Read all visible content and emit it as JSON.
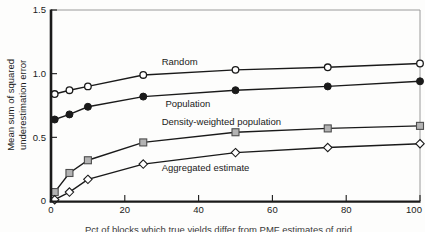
{
  "chart_data": {
    "type": "line",
    "title": "",
    "xlabel_partial_caption": "Pct of blocks which true yields differ from PMF estimates of grid",
    "ylabel": "Mean sum of squared underestimation error",
    "ylabel_lines": [
      "Mean sum of squared",
      "underestimation error"
    ],
    "x": [
      1,
      5,
      10,
      25,
      50,
      75,
      100
    ],
    "series": [
      {
        "name": "Random",
        "marker": "circle-open",
        "values": [
          0.84,
          0.87,
          0.9,
          0.99,
          1.03,
          1.05,
          1.08
        ]
      },
      {
        "name": "Population",
        "marker": "circle-filled",
        "values": [
          0.64,
          0.68,
          0.74,
          0.82,
          0.87,
          0.9,
          0.94
        ]
      },
      {
        "name": "Density-weighted population",
        "marker": "square-gray",
        "values": [
          0.07,
          0.22,
          0.32,
          0.46,
          0.54,
          0.57,
          0.59
        ]
      },
      {
        "name": "Aggregated estimate",
        "marker": "diamond-open",
        "values": [
          0.01,
          0.07,
          0.17,
          0.29,
          0.38,
          0.42,
          0.45
        ]
      }
    ],
    "xlim": [
      0,
      100
    ],
    "ylim": [
      0,
      1.5
    ],
    "x_ticks": [
      0,
      20,
      40,
      60,
      80,
      100
    ],
    "x_tick_labels": [
      "0",
      "20",
      "40",
      "60",
      "80",
      "100"
    ],
    "y_ticks": [
      0,
      0.5,
      1.0,
      1.5
    ],
    "y_tick_labels": [
      "0",
      "0.5",
      "1.0",
      "1.5"
    ],
    "grid": false,
    "legend": "inline-labels-next-to-lines",
    "annotations": [
      {
        "text": "Random",
        "x": 30,
        "y": 1.09,
        "series": "Random"
      },
      {
        "text": "Population",
        "x": 31,
        "y": 0.76,
        "series": "Population"
      },
      {
        "text": "Density-weighted population",
        "x": 30,
        "y": 0.62,
        "series": "Density-weighted population"
      },
      {
        "text": "Aggregated estimate",
        "x": 30,
        "y": 0.26,
        "series": "Aggregated estimate"
      }
    ],
    "colors": {
      "line": "#1a1a1a",
      "frame_thin": "#9a9a9a",
      "open_marker_fill": "#ffffff",
      "square_fill": "#b3b3b3",
      "square_stroke": "#4d4d4d",
      "text": "#1a1a1a"
    }
  }
}
